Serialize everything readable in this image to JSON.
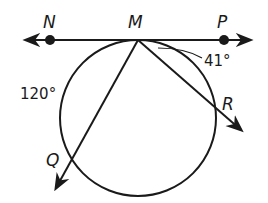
{
  "diagram": {
    "type": "circle-tangent-secant",
    "points": {
      "N": {
        "label": "N",
        "x": 50,
        "y": 40
      },
      "M": {
        "label": "M",
        "x": 138,
        "y": 40
      },
      "P": {
        "label": "P",
        "x": 224,
        "y": 40
      },
      "Q": {
        "label": "Q",
        "x": 72,
        "y": 158
      },
      "R": {
        "label": "R",
        "x": 214,
        "y": 118
      }
    },
    "circle": {
      "cx": 138,
      "cy": 118,
      "r": 78
    },
    "annotations": {
      "arc_left": "120°",
      "angle_pmr": "41°"
    },
    "colors": {
      "stroke": "#1a1a1a",
      "background": "#ffffff"
    }
  }
}
